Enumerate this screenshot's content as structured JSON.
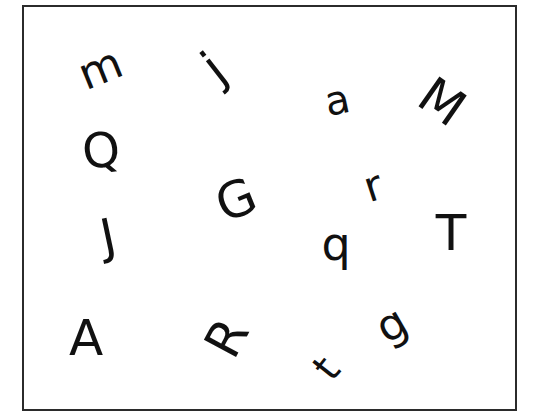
{
  "worksheet": {
    "border_color": "#2b2b2b",
    "ink_color": "#111111",
    "letters": [
      {
        "char": "m",
        "x": 100,
        "y": 68,
        "rotate": -22,
        "size": 44
      },
      {
        "char": "j",
        "x": 214,
        "y": 68,
        "rotate": -38,
        "size": 50
      },
      {
        "char": "a",
        "x": 337,
        "y": 100,
        "rotate": -12,
        "size": 40
      },
      {
        "char": "M",
        "x": 442,
        "y": 102,
        "rotate": 35,
        "size": 50
      },
      {
        "char": "Q",
        "x": 101,
        "y": 150,
        "rotate": -8,
        "size": 48
      },
      {
        "char": "G",
        "x": 236,
        "y": 200,
        "rotate": -22,
        "size": 50
      },
      {
        "char": "r",
        "x": 373,
        "y": 186,
        "rotate": -18,
        "size": 42
      },
      {
        "char": "J",
        "x": 108,
        "y": 236,
        "rotate": -12,
        "size": 48
      },
      {
        "char": "q",
        "x": 336,
        "y": 244,
        "rotate": 0,
        "size": 46
      },
      {
        "char": "T",
        "x": 451,
        "y": 233,
        "rotate": 0,
        "size": 50
      },
      {
        "char": "A",
        "x": 86,
        "y": 338,
        "rotate": 0,
        "size": 50
      },
      {
        "char": "R",
        "x": 227,
        "y": 338,
        "rotate": -62,
        "size": 50
      },
      {
        "char": "g",
        "x": 391,
        "y": 324,
        "rotate": -30,
        "size": 44
      },
      {
        "char": "t",
        "x": 326,
        "y": 368,
        "rotate": -52,
        "size": 40
      }
    ]
  }
}
